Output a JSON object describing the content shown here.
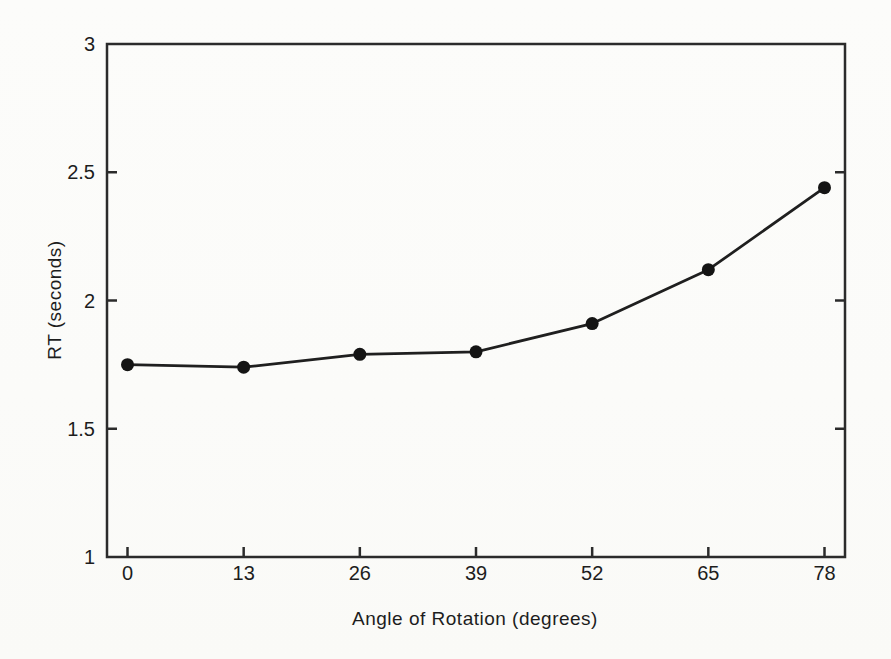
{
  "figure": {
    "xlabel": "Angle of Rotation (degrees)",
    "ylabel": "RT (seconds)"
  },
  "chart_data": {
    "type": "line",
    "title": "",
    "xlabel": "Angle of Rotation (degrees)",
    "ylabel": "RT (seconds)",
    "x": [
      0,
      13,
      26,
      39,
      52,
      65,
      78
    ],
    "xtick_labels": [
      "0",
      "13",
      "26",
      "39",
      "52",
      "65",
      "78"
    ],
    "series": [
      {
        "name": "RT",
        "values": [
          1.75,
          1.74,
          1.79,
          1.8,
          1.91,
          2.12,
          2.44
        ]
      }
    ],
    "xlim": [
      0,
      78
    ],
    "ylim": [
      1,
      3
    ],
    "yticks": [
      1,
      1.5,
      2,
      2.5,
      3
    ],
    "ytick_labels": [
      "1",
      "1.5",
      "2",
      "2.5",
      "3"
    ],
    "grid": false,
    "legend": "none",
    "marker": "filled-circle",
    "colors": {
      "line": "#1f1f1f",
      "marker": "#141414",
      "axis": "#2b2b2b",
      "text": "#1d1d1d",
      "paper": "#fbfbf9"
    }
  }
}
